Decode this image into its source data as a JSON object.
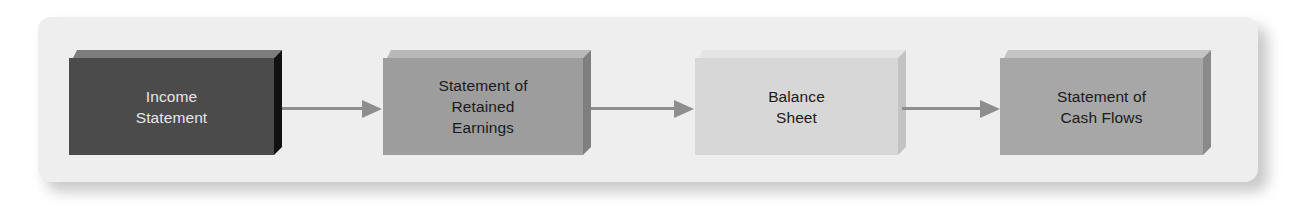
{
  "diagram": {
    "type": "flowchart",
    "direction": "left-to-right",
    "nodes": [
      {
        "id": "income-statement",
        "lines": [
          "Income",
          "Statement"
        ],
        "colors": {
          "front": "#4b4b4b",
          "top": "#7d7d7d",
          "side": "#111111",
          "text": "#e6e6e6"
        }
      },
      {
        "id": "retained-earnings",
        "lines": [
          "Statement of",
          "Retained",
          "Earnings"
        ],
        "colors": {
          "front": "#9d9d9d",
          "top": "#b9b9b9",
          "side": "#7f7f7f",
          "text": "#1a1a1a"
        }
      },
      {
        "id": "balance-sheet",
        "lines": [
          "Balance",
          "Sheet"
        ],
        "colors": {
          "front": "#d7d7d7",
          "top": "#e4e4e4",
          "side": "#c3c3c3",
          "text": "#1a1a1a"
        }
      },
      {
        "id": "cash-flows",
        "lines": [
          "Statement of",
          "Cash Flows"
        ],
        "colors": {
          "front": "#a7a7a7",
          "top": "#c4c4c4",
          "side": "#8a8a8a",
          "text": "#1a1a1a"
        }
      }
    ],
    "edges": [
      {
        "from": "income-statement",
        "to": "retained-earnings"
      },
      {
        "from": "retained-earnings",
        "to": "balance-sheet"
      },
      {
        "from": "balance-sheet",
        "to": "cash-flows"
      }
    ],
    "colors": {
      "panel": "#eeeeee",
      "arrow": "#8e8e8e"
    }
  }
}
